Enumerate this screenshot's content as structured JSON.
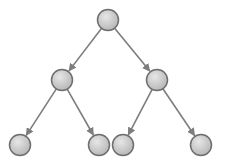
{
  "diagram": {
    "type": "tree",
    "kind": "binary-tree",
    "colors": {
      "node_fill_light": "#e6e6e6",
      "node_fill_dark": "#b5b5b5",
      "node_stroke": "#6e6e6e",
      "edge": "#7d7d7d"
    },
    "nodes": [
      {
        "id": "root",
        "level": 0,
        "label": ""
      },
      {
        "id": "left",
        "level": 1,
        "label": ""
      },
      {
        "id": "right",
        "level": 1,
        "label": ""
      },
      {
        "id": "left-left",
        "level": 2,
        "label": ""
      },
      {
        "id": "left-right",
        "level": 2,
        "label": ""
      },
      {
        "id": "right-left",
        "level": 2,
        "label": ""
      },
      {
        "id": "right-right",
        "level": 2,
        "label": ""
      }
    ],
    "edges": [
      {
        "from": "root",
        "to": "left",
        "directed": true
      },
      {
        "from": "root",
        "to": "right",
        "directed": true
      },
      {
        "from": "left",
        "to": "left-left",
        "directed": true
      },
      {
        "from": "left",
        "to": "left-right",
        "directed": true
      },
      {
        "from": "right",
        "to": "right-left",
        "directed": true
      },
      {
        "from": "right",
        "to": "right-right",
        "directed": true
      }
    ]
  }
}
